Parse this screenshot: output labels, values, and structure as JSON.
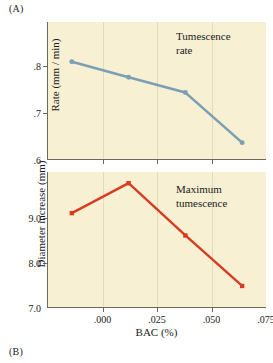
{
  "figure": {
    "panel_a_tag": "(A)",
    "panel_b_tag": "(B)",
    "xlabel": "BAC (%)",
    "xticklabels": [
      ".000",
      ".025",
      ".050",
      ".075"
    ],
    "colors": {
      "plot_background": "#f7f0d3",
      "axis": "#6d6a5c",
      "series_tumescence_rate": "#7b9fb5",
      "series_maximum_tumescence": "#d93b22",
      "text": "#1b1b1b"
    }
  },
  "chart_data": [
    {
      "type": "line",
      "panel": "(A)",
      "title": "Tumescence rate",
      "annotation_line1": "Tumescence",
      "annotation_line2": "rate",
      "xlabel": "BAC (%)",
      "ylabel": "Rate (mm / min)",
      "categories": [
        ".000",
        ".025",
        ".050",
        ".075"
      ],
      "x": [
        0.0,
        0.025,
        0.05,
        0.075
      ],
      "values": [
        0.808,
        0.775,
        0.742,
        0.635
      ],
      "yticklabels": [
        ".8",
        ".7",
        ".6"
      ],
      "yticks": [
        0.8,
        0.7,
        0.6
      ],
      "ylim": [
        0.6,
        0.893
      ],
      "xlim": [
        -0.0105,
        0.0855
      ],
      "grid": false,
      "marker": "circle",
      "color": "#7b9fb5",
      "legend": "none"
    },
    {
      "type": "line",
      "panel": "(B)",
      "title": "Maximum tumescence",
      "annotation_line1": "Maximum",
      "annotation_line2": "tumescence",
      "xlabel": "BAC (%)",
      "ylabel": "Diameter increase (mm)",
      "categories": [
        ".000",
        ".025",
        ".050",
        ".075"
      ],
      "x": [
        0.0,
        0.025,
        0.05,
        0.075
      ],
      "values": [
        9.1,
        9.77,
        8.6,
        7.47
      ],
      "yticklabels": [
        "9.0",
        "8.0",
        "7.0"
      ],
      "yticks": [
        9.0,
        8.0,
        7.0
      ],
      "ylim": [
        7.0,
        10.02
      ],
      "xlim": [
        -0.0105,
        0.0855
      ],
      "grid": false,
      "marker": "square",
      "color": "#d93b22",
      "legend": "none"
    }
  ]
}
